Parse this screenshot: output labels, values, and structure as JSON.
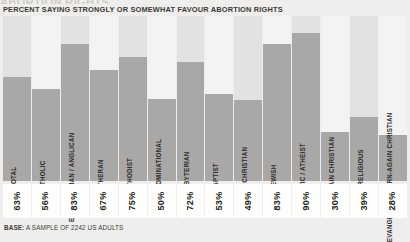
{
  "header": {
    "cut_title": "ABORTION RIGHTS",
    "subtitle": "PERCENT SAYING STRONGLY OR SOMEWHAT FAVOUR ABORTION RIGHTS"
  },
  "footer": {
    "base_label": "BASE:",
    "base_text": " A SAMPLE OF 2242 US ADULTS"
  },
  "colors": {
    "bar": "#a9a8a6",
    "band_dark": "#e3e2e0",
    "band_light": "#f4f3f1",
    "page_background": "#efeeec",
    "value_box": "#fdfdfc",
    "text": "#231f20"
  },
  "chart_data": {
    "type": "bar",
    "title": "ABORTION RIGHTS",
    "subtitle": "PERCENT SAYING STRONGLY OR SOMEWHAT FAVOUR ABORTION RIGHTS",
    "xlabel": "",
    "ylabel": "",
    "ylim": [
      0,
      100
    ],
    "grid": false,
    "legend": "none",
    "value_suffix": "%",
    "categories": [
      "TOTAL",
      "CATHOLIC",
      "EPISCOPALIAN / ANGLICAN",
      "LUTHERAN",
      "METHODIST",
      "NON-DENOMINATIONAL",
      "PRESBYTERIAN",
      "BAPTIST",
      "OTHER CHRISTIAN",
      "JEWISH",
      "AGNOSTIC / ATHEIST",
      "BORN-AGAIN CHRISTIAN",
      "VERY RELIGIOUS",
      "EVANGELICAL BORN-AGAIN CHRISTIAN"
    ],
    "values": [
      63,
      56,
      83,
      67,
      75,
      50,
      72,
      53,
      49,
      83,
      90,
      30,
      39,
      28
    ],
    "value_labels": [
      "63%",
      "56%",
      "83%",
      "67%",
      "75%",
      "50%",
      "72%",
      "53%",
      "49%",
      "83%",
      "90%",
      "30%",
      "39%",
      "28%"
    ]
  }
}
